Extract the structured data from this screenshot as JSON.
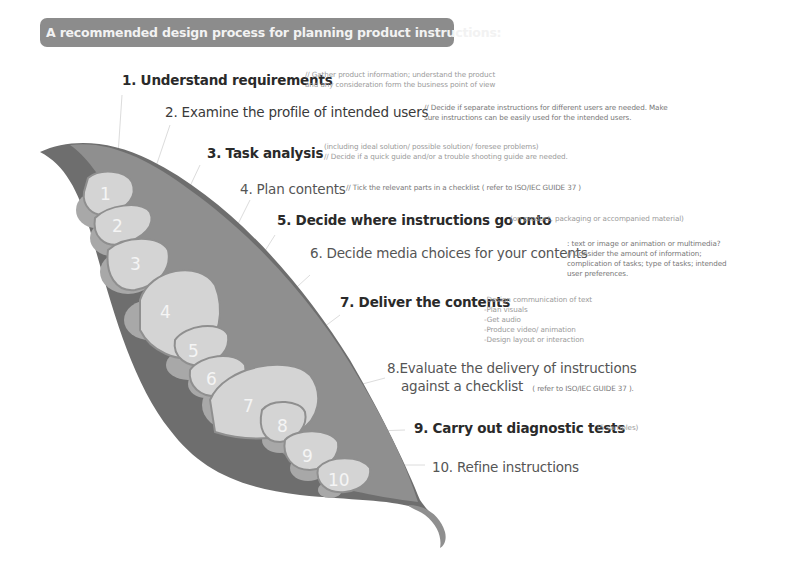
{
  "title": "A recommended design process for planning product instructions:",
  "colors": {
    "banner": "#8c8c8c",
    "pod_dark": "#6e6e6e",
    "pod_mid": "#8f8f8f",
    "pea_light": "#d4d4d4",
    "pea_mid": "#a6a6a6"
  },
  "steps": [
    {
      "number": "1",
      "title": "1. Understand requirements",
      "notes": [
        "// Gather product information; understand the product",
        "and any consideration form the business point of view"
      ]
    },
    {
      "number": "2",
      "title": "2. Examine the profile of intended users",
      "notes": [
        "// Decide if separate instructions for different users are needed. Make",
        "sure instructions can be easily used for the intended users."
      ]
    },
    {
      "number": "3",
      "title": "3. Task analysis",
      "notes": [
        "(including ideal solution/ possible solution/ foresee problems)",
        "// Decide if a quick guide and/or a trouble shooting guide are needed."
      ]
    },
    {
      "number": "4",
      "title": "4. Plan contents",
      "notes": [
        "// Tick the relevant parts in a checklist ( refer to ISO/IEC GUIDE 37 )"
      ]
    },
    {
      "number": "5",
      "title": "5. Decide where instructions go onto",
      "notes": [
        "(on product, packaging or accompanied material)"
      ]
    },
    {
      "number": "6",
      "title": "6. Decide media choices for your contents",
      "notes": [
        ": text or image or animation or multimedia?",
        "// Consider the amount of information;",
        "complication of tasks; type of tasks; intended",
        "user preferences."
      ]
    },
    {
      "number": "7",
      "title": "7. Deliver the contents",
      "notes": [
        "-Design communication of text",
        "-Plan visuals",
        "-Get audio",
        "-Produce video/ animation",
        "-Design layout or interaction"
      ]
    },
    {
      "number": "8",
      "title_line1": "8.Evaluate the delivery of instructions",
      "title_line2": "against a checklist",
      "notes": [
        "( refer to ISO/IEC GUIDE 37 )."
      ]
    },
    {
      "number": "9",
      "title": "9. Carry out diagnostic tests",
      "notes": [
        "(5 samples)"
      ]
    },
    {
      "number": "10",
      "title": "10. Refine instructions",
      "notes": []
    }
  ]
}
